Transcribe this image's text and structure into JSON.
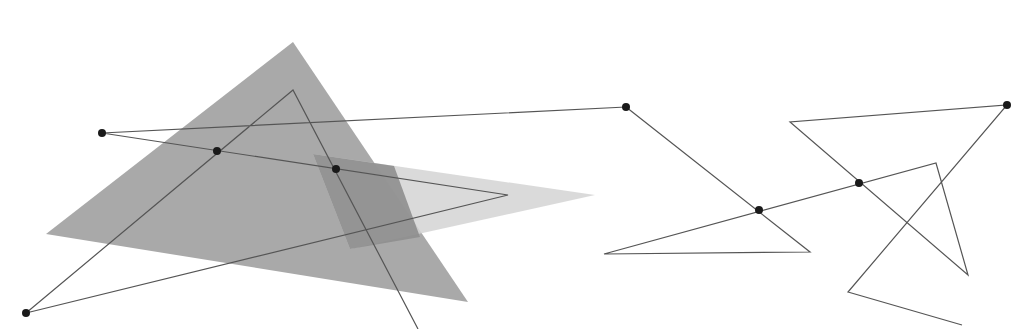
{
  "diagram": {
    "width": 1017,
    "height": 329,
    "background": "#ffffff",
    "colors": {
      "big_triangle": "#a9a9a9",
      "light_triangle": "#d3d3d3",
      "overlap_region": "#8e8e8e",
      "line": "#555555",
      "point": "#1a1a1a"
    },
    "shapes": {
      "big_triangle": [
        [
          293,
          42
        ],
        [
          46,
          234
        ],
        [
          468,
          302
        ]
      ],
      "light_triangle": [
        [
          313,
          154
        ],
        [
          595,
          195
        ],
        [
          350,
          249
        ]
      ],
      "overlap_region": [
        [
          313,
          154
        ],
        [
          394,
          166
        ],
        [
          420,
          237
        ],
        [
          350,
          249
        ]
      ]
    },
    "polylines": [
      {
        "name": "left-path",
        "points": [
          [
            626,
            107
          ],
          [
            102,
            133
          ],
          [
            508,
            195
          ],
          [
            26,
            313
          ],
          [
            293,
            90
          ],
          [
            418,
            329
          ]
        ]
      },
      {
        "name": "right-path",
        "points": [
          [
            626,
            107
          ],
          [
            810,
            252
          ],
          [
            604,
            254
          ],
          [
            936,
            163
          ],
          [
            968,
            275
          ],
          [
            790,
            122
          ],
          [
            1007,
            105
          ],
          [
            848,
            292
          ],
          [
            962,
            325
          ]
        ]
      }
    ],
    "points": [
      [
        102,
        133
      ],
      [
        217,
        151
      ],
      [
        336,
        169
      ],
      [
        26,
        313
      ],
      [
        626,
        107
      ],
      [
        759,
        210
      ],
      [
        859,
        183
      ],
      [
        1007,
        105
      ]
    ]
  }
}
